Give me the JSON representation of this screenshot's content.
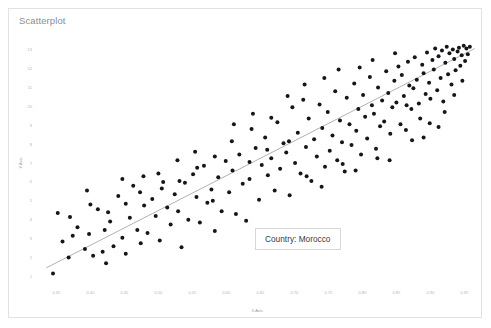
{
  "card": {
    "title": "Scatterplot"
  },
  "tooltip": {
    "text": "Country: Morocco"
  },
  "chart_data": {
    "type": "scatter",
    "title": "Scatterplot",
    "xlabel": "X-Axis",
    "ylabel": "Y-Axis",
    "xlim": [
      0.32,
      0.97
    ],
    "ylim": [
      0.6,
      13.4
    ],
    "grid": false,
    "legend": null,
    "xticks": [
      0.35,
      0.4,
      0.45,
      0.5,
      0.55,
      0.6,
      0.65,
      0.7,
      0.75,
      0.8,
      0.85,
      0.9,
      0.95
    ],
    "xticklabels": [
      "0.35",
      "0.40",
      "0.45",
      "0.50",
      "0.55",
      "0.60",
      "0.65",
      "0.70",
      "0.75",
      "0.80",
      "0.85",
      "0.90",
      "0.95"
    ],
    "yticks": [
      1,
      2,
      3,
      4,
      5,
      6,
      7,
      8,
      9,
      10,
      11,
      12,
      13
    ],
    "yticklabels": [
      "1",
      "2",
      "3",
      "4",
      "5",
      "6",
      "7",
      "8",
      "9",
      "10",
      "11",
      "12",
      "13"
    ],
    "marker": {
      "color": "#14161a",
      "size": 4,
      "shape": "circle"
    },
    "trendline": {
      "color": "#9d9d9d",
      "x": [
        0.335,
        0.965
      ],
      "y": [
        1.45,
        13.05
      ]
    },
    "annotations": [
      {
        "text": "Country: Morocco",
        "x": 0.655,
        "y": 3.5
      }
    ],
    "points": [
      [
        0.345,
        1.15
      ],
      [
        0.352,
        4.35
      ],
      [
        0.368,
        2.0
      ],
      [
        0.381,
        3.6
      ],
      [
        0.392,
        2.45
      ],
      [
        0.398,
        3.25
      ],
      [
        0.404,
        2.1
      ],
      [
        0.411,
        4.55
      ],
      [
        0.418,
        2.3
      ],
      [
        0.423,
        1.7
      ],
      [
        0.429,
        3.9
      ],
      [
        0.434,
        2.6
      ],
      [
        0.441,
        5.25
      ],
      [
        0.447,
        3.05
      ],
      [
        0.452,
        2.2
      ],
      [
        0.458,
        4.1
      ],
      [
        0.463,
        5.8
      ],
      [
        0.469,
        3.45
      ],
      [
        0.474,
        2.75
      ],
      [
        0.479,
        4.75
      ],
      [
        0.484,
        3.3
      ],
      [
        0.491,
        5.1
      ],
      [
        0.496,
        4.2
      ],
      [
        0.502,
        2.9
      ],
      [
        0.507,
        6.0
      ],
      [
        0.513,
        4.65
      ],
      [
        0.518,
        3.75
      ],
      [
        0.524,
        5.35
      ],
      [
        0.529,
        4.45
      ],
      [
        0.534,
        2.55
      ],
      [
        0.539,
        5.95
      ],
      [
        0.544,
        4.0
      ],
      [
        0.551,
        6.4
      ],
      [
        0.556,
        5.2
      ],
      [
        0.561,
        3.85
      ],
      [
        0.567,
        6.85
      ],
      [
        0.572,
        4.9
      ],
      [
        0.578,
        5.6
      ],
      [
        0.583,
        3.4
      ],
      [
        0.588,
        6.25
      ],
      [
        0.593,
        4.45
      ],
      [
        0.599,
        7.1
      ],
      [
        0.604,
        5.45
      ],
      [
        0.609,
        6.6
      ],
      [
        0.614,
        4.3
      ],
      [
        0.619,
        7.45
      ],
      [
        0.624,
        5.9
      ],
      [
        0.629,
        3.95
      ],
      [
        0.634,
        6.15
      ],
      [
        0.639,
        9.6
      ],
      [
        0.643,
        7.8
      ],
      [
        0.648,
        5.05
      ],
      [
        0.652,
        6.9
      ],
      [
        0.657,
        8.35
      ],
      [
        0.661,
        6.35
      ],
      [
        0.666,
        7.25
      ],
      [
        0.671,
        5.55
      ],
      [
        0.675,
        9.15
      ],
      [
        0.679,
        6.7
      ],
      [
        0.684,
        8.05
      ],
      [
        0.688,
        7.55
      ],
      [
        0.693,
        5.3
      ],
      [
        0.697,
        9.95
      ],
      [
        0.701,
        7.0
      ],
      [
        0.705,
        8.6
      ],
      [
        0.709,
        6.45
      ],
      [
        0.713,
        10.35
      ],
      [
        0.717,
        7.85
      ],
      [
        0.721,
        9.35
      ],
      [
        0.725,
        6.05
      ],
      [
        0.729,
        8.25
      ],
      [
        0.733,
        7.35
      ],
      [
        0.737,
        10.1
      ],
      [
        0.741,
        8.85
      ],
      [
        0.745,
        6.8
      ],
      [
        0.749,
        9.7
      ],
      [
        0.752,
        7.65
      ],
      [
        0.756,
        8.45
      ],
      [
        0.76,
        10.8
      ],
      [
        0.763,
        7.15
      ],
      [
        0.767,
        9.25
      ],
      [
        0.77,
        8.1
      ],
      [
        0.774,
        6.55
      ],
      [
        0.777,
        10.45
      ],
      [
        0.781,
        9.05
      ],
      [
        0.784,
        7.95
      ],
      [
        0.788,
        11.2
      ],
      [
        0.791,
        8.7
      ],
      [
        0.794,
        9.85
      ],
      [
        0.798,
        7.45
      ],
      [
        0.801,
        10.6
      ],
      [
        0.804,
        9.45
      ],
      [
        0.807,
        8.3
      ],
      [
        0.811,
        11.55
      ],
      [
        0.814,
        10.05
      ],
      [
        0.817,
        9.6
      ],
      [
        0.82,
        7.75
      ],
      [
        0.823,
        11.0
      ],
      [
        0.826,
        8.95
      ],
      [
        0.829,
        10.3
      ],
      [
        0.832,
        9.2
      ],
      [
        0.835,
        11.85
      ],
      [
        0.838,
        10.7
      ],
      [
        0.841,
        8.55
      ],
      [
        0.844,
        9.95
      ],
      [
        0.847,
        11.35
      ],
      [
        0.85,
        10.2
      ],
      [
        0.853,
        12.1
      ],
      [
        0.856,
        9.05
      ],
      [
        0.858,
        11.65
      ],
      [
        0.861,
        10.55
      ],
      [
        0.864,
        8.75
      ],
      [
        0.867,
        12.35
      ],
      [
        0.869,
        11.1
      ],
      [
        0.872,
        9.85
      ],
      [
        0.875,
        10.95
      ],
      [
        0.877,
        12.6
      ],
      [
        0.88,
        11.4
      ],
      [
        0.883,
        10.15
      ],
      [
        0.885,
        9.35
      ],
      [
        0.888,
        12.2
      ],
      [
        0.89,
        11.75
      ],
      [
        0.893,
        10.65
      ],
      [
        0.895,
        12.85
      ],
      [
        0.898,
        11.25
      ],
      [
        0.9,
        10.4
      ],
      [
        0.903,
        12.45
      ],
      [
        0.905,
        11.95
      ],
      [
        0.907,
        13.05
      ],
      [
        0.91,
        10.85
      ],
      [
        0.912,
        12.65
      ],
      [
        0.915,
        11.5
      ],
      [
        0.917,
        12.95
      ],
      [
        0.919,
        10.25
      ],
      [
        0.922,
        12.3
      ],
      [
        0.924,
        13.15
      ],
      [
        0.926,
        11.7
      ],
      [
        0.928,
        12.8
      ],
      [
        0.931,
        11.15
      ],
      [
        0.933,
        13.0
      ],
      [
        0.935,
        12.5
      ],
      [
        0.937,
        11.9
      ],
      [
        0.94,
        12.9
      ],
      [
        0.942,
        13.1
      ],
      [
        0.944,
        12.15
      ],
      [
        0.946,
        12.7
      ],
      [
        0.949,
        13.2
      ],
      [
        0.951,
        12.4
      ],
      [
        0.953,
        13.05
      ],
      [
        0.955,
        12.75
      ],
      [
        0.958,
        13.15
      ],
      [
        0.637,
        8.8
      ],
      [
        0.666,
        9.4
      ],
      [
        0.692,
        8.15
      ],
      [
        0.718,
        6.3
      ],
      [
        0.744,
        11.5
      ],
      [
        0.771,
        6.95
      ],
      [
        0.796,
        12.05
      ],
      [
        0.822,
        7.25
      ],
      [
        0.848,
        12.8
      ],
      [
        0.873,
        8.2
      ],
      [
        0.899,
        9.1
      ],
      [
        0.921,
        9.7
      ],
      [
        0.611,
        9.05
      ],
      [
        0.583,
        7.35
      ],
      [
        0.557,
        6.75
      ],
      [
        0.531,
        6.05
      ],
      [
        0.505,
        5.65
      ],
      [
        0.478,
        6.3
      ],
      [
        0.452,
        4.85
      ],
      [
        0.426,
        4.4
      ],
      [
        0.4,
        4.8
      ],
      [
        0.374,
        3.15
      ],
      [
        0.359,
        2.85
      ],
      [
        0.69,
        10.55
      ],
      [
        0.715,
        11.15
      ],
      [
        0.74,
        5.75
      ],
      [
        0.765,
        11.95
      ],
      [
        0.79,
        6.6
      ],
      [
        0.815,
        12.45
      ],
      [
        0.84,
        7.15
      ],
      [
        0.865,
        10.05
      ],
      [
        0.89,
        8.35
      ],
      [
        0.912,
        8.9
      ],
      [
        0.935,
        10.6
      ],
      [
        0.947,
        11.35
      ],
      [
        0.66,
        7.7
      ],
      [
        0.634,
        7.05
      ],
      [
        0.608,
        8.15
      ],
      [
        0.58,
        5.0
      ],
      [
        0.554,
        7.6
      ],
      [
        0.528,
        7.15
      ],
      [
        0.5,
        6.45
      ],
      [
        0.473,
        5.45
      ],
      [
        0.447,
        6.15
      ],
      [
        0.421,
        3.45
      ],
      [
        0.395,
        5.55
      ],
      [
        0.37,
        4.15
      ]
    ]
  }
}
